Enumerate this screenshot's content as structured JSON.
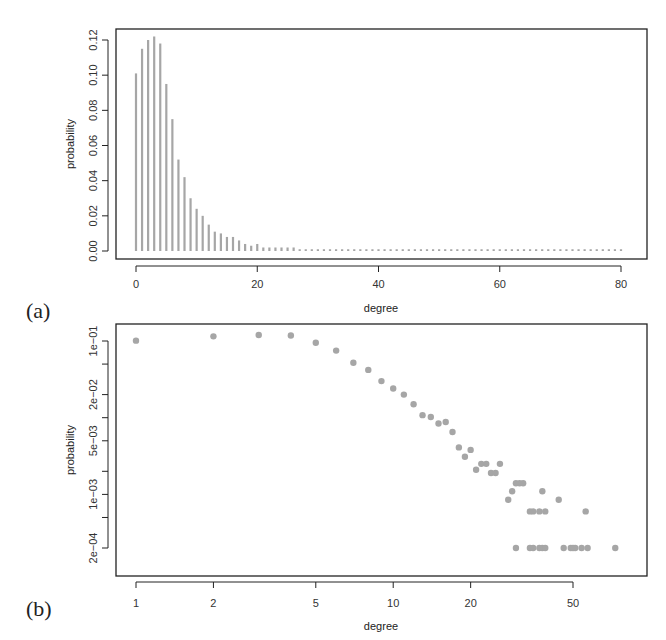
{
  "chart_data": [
    {
      "panel": "(a)",
      "type": "bar",
      "title": "",
      "xlabel": "degree",
      "ylabel": "probability",
      "xlim": [
        -3,
        84
      ],
      "ylim": [
        -0.005,
        0.126
      ],
      "xticks": [
        0,
        20,
        40,
        60,
        80
      ],
      "xtick_labels": [
        "0",
        "20",
        "40",
        "60",
        "80"
      ],
      "yticks": [
        0.0,
        0.02,
        0.04,
        0.06,
        0.08,
        0.1,
        0.12
      ],
      "ytick_labels": [
        "0.00",
        "0.02",
        "0.04",
        "0.06",
        "0.08",
        "0.10",
        "0.12"
      ],
      "grid": false,
      "legend": null,
      "style": "vertical spikes (type='h'), grey",
      "x": [
        0,
        1,
        2,
        3,
        4,
        5,
        6,
        7,
        8,
        9,
        10,
        11,
        12,
        13,
        14,
        15,
        16,
        17,
        18,
        19,
        20,
        21,
        22,
        23,
        24,
        25,
        26,
        27,
        28,
        29,
        30,
        31,
        32,
        33,
        34,
        35,
        36,
        37,
        38,
        39,
        40,
        41,
        42,
        43,
        44,
        45,
        46,
        47,
        48,
        49,
        50,
        51,
        52,
        53,
        54,
        55,
        56,
        57,
        58,
        59,
        60,
        61,
        62,
        63,
        64,
        65,
        66,
        67,
        68,
        69,
        70,
        71,
        72,
        73,
        74,
        75,
        76,
        77,
        78,
        79,
        80
      ],
      "values": [
        0.101,
        0.115,
        0.12,
        0.122,
        0.118,
        0.095,
        0.075,
        0.052,
        0.042,
        0.03,
        0.024,
        0.02,
        0.015,
        0.011,
        0.01,
        0.008,
        0.008,
        0.006,
        0.004,
        0.003,
        0.004,
        0.002,
        0.002,
        0.002,
        0.002,
        0.002,
        0.002,
        0.001,
        0.001,
        0.001,
        0.001,
        0.001,
        0.001,
        0.001,
        0.001,
        0.001,
        0.001,
        0.001,
        0.001,
        0.001,
        0.001,
        0.001,
        0.001,
        0.001,
        0.001,
        0.001,
        0.001,
        0.001,
        0.001,
        0.001,
        0.001,
        0.001,
        0.001,
        0.001,
        0.001,
        0.001,
        0.001,
        0.001,
        0.001,
        0.001,
        0.001,
        0.001,
        0.001,
        0.001,
        0.001,
        0.001,
        0.001,
        0.001,
        0.001,
        0.001,
        0.001,
        0.001,
        0.001,
        0.001,
        0.001,
        0.001,
        0.001,
        0.001,
        0.001,
        0.001,
        0.001
      ]
    },
    {
      "panel": "(b)",
      "type": "scatter",
      "title": "",
      "xlabel": "degree",
      "ylabel": "probability",
      "xscale": "log",
      "yscale": "log",
      "xlim": [
        0.87,
        85
      ],
      "ylim": [
        0.00017,
        0.13
      ],
      "xticks": [
        1,
        2,
        5,
        10,
        20,
        50
      ],
      "xtick_labels": [
        "1",
        "2",
        "5",
        "10",
        "20",
        "50"
      ],
      "yticks": [
        0.1,
        0.05,
        0.02,
        0.01,
        0.005,
        0.002,
        0.001,
        0.0005,
        0.0002
      ],
      "ytick_labels": [
        "1e−01",
        "",
        "2e−02",
        "",
        "5e−03",
        "",
        "1e−03",
        "",
        "2e−04"
      ],
      "grid": false,
      "legend": null,
      "style": "filled grey circles",
      "points": [
        [
          1,
          0.101
        ],
        [
          2,
          0.115
        ],
        [
          3,
          0.12
        ],
        [
          4,
          0.118
        ],
        [
          5,
          0.095
        ],
        [
          6,
          0.075
        ],
        [
          7,
          0.052
        ],
        [
          8,
          0.042
        ],
        [
          9,
          0.03
        ],
        [
          10,
          0.024
        ],
        [
          11,
          0.02
        ],
        [
          12,
          0.015
        ],
        [
          13,
          0.0108
        ],
        [
          14,
          0.0102
        ],
        [
          15,
          0.0084
        ],
        [
          16,
          0.0088
        ],
        [
          17,
          0.0065
        ],
        [
          18,
          0.0041
        ],
        [
          19,
          0.0031
        ],
        [
          20,
          0.0038
        ],
        [
          21,
          0.0021
        ],
        [
          22,
          0.0025
        ],
        [
          23,
          0.0025
        ],
        [
          24,
          0.0019
        ],
        [
          25,
          0.0019
        ],
        [
          26,
          0.0025
        ],
        [
          28,
          0.00085
        ],
        [
          29,
          0.0011
        ],
        [
          30,
          0.0014
        ],
        [
          31,
          0.0014
        ],
        [
          32,
          0.0014
        ],
        [
          34,
          0.0006
        ],
        [
          35,
          0.0006
        ],
        [
          37,
          0.0006
        ],
        [
          38,
          0.0011
        ],
        [
          39,
          0.0006
        ],
        [
          44,
          0.00085
        ],
        [
          56,
          0.0006
        ],
        [
          30,
          0.0002
        ],
        [
          34,
          0.0002
        ],
        [
          35,
          0.0002
        ],
        [
          37,
          0.0002
        ],
        [
          38,
          0.0002
        ],
        [
          39,
          0.0002
        ],
        [
          46,
          0.0002
        ],
        [
          49,
          0.0002
        ],
        [
          50,
          0.0002
        ],
        [
          51,
          0.0002
        ],
        [
          54,
          0.0002
        ],
        [
          57,
          0.0002
        ],
        [
          73,
          0.0002
        ]
      ]
    }
  ],
  "figure": {
    "panel_labels": [
      "(a)",
      "(b)"
    ],
    "colors": {
      "series": "#a6a6a6",
      "axis": "#222222",
      "text": "#333333",
      "background": "#ffffff"
    }
  }
}
